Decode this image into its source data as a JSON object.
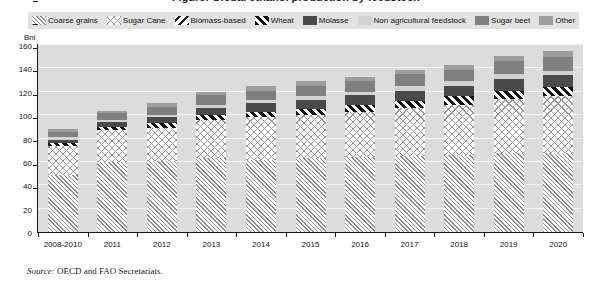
{
  "title": "Figure: Global ethanol production by feedstock",
  "axis": {
    "y_unit": "Bnl",
    "y_ticks": [
      0,
      20,
      40,
      60,
      80,
      100,
      120,
      140,
      160
    ],
    "y_min": 0,
    "y_max": 160
  },
  "legend": {
    "items": [
      {
        "label": "Coarse grains",
        "pattern": "diagonal-hatch-light",
        "color": "#8c8c8c"
      },
      {
        "label": "Sugar Cane",
        "pattern": "diamond-crosshatch",
        "color": "#9a9a9a"
      },
      {
        "label": "Biomass-based",
        "pattern": "back-diagonal-dark",
        "color": "#1c1c1c"
      },
      {
        "label": "Wheat",
        "pattern": "thick-diagonal-dark",
        "color": "#111111"
      },
      {
        "label": "Molasse",
        "pattern": "solid",
        "color": "#4a4a4a"
      },
      {
        "label": "Non agricultural feedstock",
        "pattern": "solid",
        "color": "#d2d2d2"
      },
      {
        "label": "Sugar beet",
        "pattern": "solid",
        "color": "#808080"
      },
      {
        "label": "Other",
        "pattern": "solid",
        "color": "#9d9d9d"
      }
    ]
  },
  "source": {
    "label": "Source:",
    "text": "OECD and FAO Secretariats."
  },
  "chart_data": {
    "type": "bar",
    "stacked": true,
    "title": "Global ethanol production by feedstock",
    "xlabel": "",
    "ylabel": "Bnl",
    "ylim": [
      0,
      160
    ],
    "grid": true,
    "legend_position": "top",
    "categories": [
      "2008-2010",
      "2011",
      "2012",
      "2013",
      "2014",
      "2015",
      "2016",
      "2017",
      "2018",
      "2019",
      "2020"
    ],
    "series": [
      {
        "name": "Coarse grains",
        "values": [
          49,
          60,
          61,
          63,
          62,
          63,
          64,
          65,
          66,
          68,
          68
        ]
      },
      {
        "name": "Sugar Cane",
        "values": [
          25,
          27,
          28,
          33,
          36,
          37,
          39,
          41,
          43,
          46,
          48
        ]
      },
      {
        "name": "Biomass-based",
        "values": [
          0,
          0,
          0,
          0,
          0,
          0,
          0,
          0,
          0,
          0,
          0
        ]
      },
      {
        "name": "Wheat",
        "values": [
          2,
          3,
          4,
          4,
          5,
          5,
          6,
          6,
          7,
          7,
          8
        ]
      },
      {
        "name": "Molasse",
        "values": [
          3,
          4,
          5,
          6,
          7,
          8,
          8,
          9,
          9,
          10,
          10
        ]
      },
      {
        "name": "Non agricultural feedstock",
        "values": [
          2,
          2,
          2,
          3,
          3,
          3,
          3,
          4,
          4,
          4,
          4
        ]
      },
      {
        "name": "Sugar beet",
        "values": [
          5,
          6,
          7,
          8,
          8,
          9,
          9,
          10,
          10,
          11,
          12
        ]
      },
      {
        "name": "Other",
        "values": [
          2,
          2,
          3,
          3,
          4,
          4,
          4,
          4,
          4,
          5,
          5
        ]
      }
    ],
    "totals": [
      88,
      104,
      110,
      120,
      125,
      129,
      133,
      139,
      143,
      151,
      155
    ]
  }
}
